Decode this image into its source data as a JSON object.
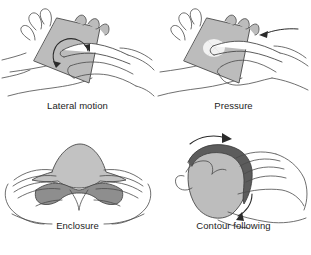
{
  "figure": {
    "background_color": "#ffffff",
    "line_color": "#4a4a4a",
    "object_fill_color": "#b9b9b9",
    "object_shadow_color": "#6f6f6f",
    "caption_color": "#1c1c1c",
    "columns": 2,
    "rows": 2
  },
  "panels": [
    {
      "id": "lateral-motion",
      "caption": "Lateral motion",
      "position": "top-left",
      "object_shape": "square-tile",
      "arrow": "curved-loop-arrow",
      "hands": 2
    },
    {
      "id": "pressure",
      "caption": "Pressure",
      "position": "top-right",
      "object_shape": "square-tile",
      "arrow": "straight-left-arrow",
      "hands": 2
    },
    {
      "id": "enclosure",
      "caption": "Enclosure",
      "position": "bottom-left",
      "object_shape": "blob",
      "arrow": "none",
      "hands": 2
    },
    {
      "id": "contour-following",
      "caption": "Contour following",
      "position": "bottom-right",
      "object_shape": "rounded-blob",
      "arrow": "two-curved-arrows",
      "hands": 2
    }
  ]
}
